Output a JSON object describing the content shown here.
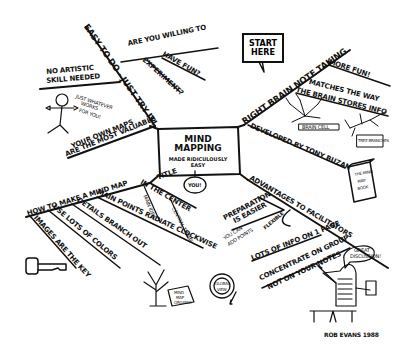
{
  "center": {
    "title_line1": "Mind",
    "title_line2": "Mapping",
    "subtitle_line1": "made ridiculously",
    "subtitle_line2": "easy"
  },
  "start_callout": {
    "line1": "Start",
    "line2": "Here"
  },
  "branches": {
    "easy_to_do": {
      "label": "Easy to do - just try it!",
      "children": [
        {
          "label": "Are you willing to"
        },
        {
          "label": "have fun?"
        },
        {
          "label": "experiment?"
        }
      ]
    },
    "no_artistic": {
      "line1": "No artistic",
      "line2": "skill needed",
      "speech": [
        "Just whatever",
        "works",
        "for you!"
      ]
    },
    "own_maps": {
      "line1": "Your own maps",
      "line2": "are the most valuable"
    },
    "right_brain": {
      "label": "Right brain note taking",
      "children": [
        {
          "label": "More fun!"
        },
        {
          "line1": "Matches the way",
          "line2": "the brain stores info"
        },
        {
          "label": "Developed by Tony Buzan"
        }
      ],
      "tree_labels": [
        "Brain cell",
        "Tree branches"
      ],
      "book_label": [
        "The Mind",
        "Map",
        "Book"
      ]
    },
    "how_to": {
      "label": "How to make a mind map",
      "children": [
        {
          "label": "Main points radiate clockwise"
        },
        {
          "label": "Details branch out"
        },
        {
          "label": "Use lots of colors"
        },
        {
          "label": "Images are the key"
        }
      ]
    },
    "title_center": {
      "line1": "Title",
      "line2": "in the center",
      "children": [
        {
          "label": "Main idea"
        },
        {
          "label": "Central theme"
        }
      ],
      "you_bubble": "You!"
    },
    "advantages": {
      "label": "Advantages to facilitators",
      "children": [
        {
          "line1": "Preparation",
          "line2": "is easier"
        },
        {
          "line1": "You can",
          "line2": "add points"
        },
        {
          "label": "Flexible"
        },
        {
          "label": "Lots of info on 1 page"
        },
        {
          "line1": "Concentrate on group",
          "line2": "not on your notes"
        }
      ],
      "speech": [
        "Great",
        "discussion!"
      ]
    },
    "doodles": {
      "tree_sign": [
        "Mind",
        "Map",
        "Organic"
      ],
      "globe_label": [
        "Global",
        "view"
      ]
    }
  },
  "signature": "Rob Evans 1988",
  "colors": {
    "ink": "#111111",
    "paper": "#ffffff"
  }
}
